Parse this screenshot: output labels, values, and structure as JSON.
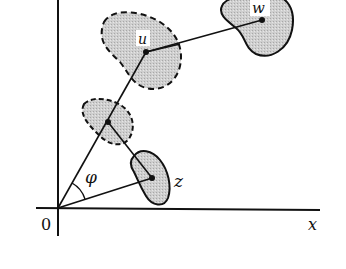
{
  "diagram": {
    "axes": {
      "x_label": "x",
      "origin_label": "0"
    },
    "points": {
      "u": {
        "label": "u",
        "x": 146,
        "y": 52
      },
      "w": {
        "label": "w",
        "x": 262,
        "y": 20
      },
      "z": {
        "label": "z",
        "x": 152,
        "y": 178
      },
      "mid": {
        "x": 108,
        "y": 122
      }
    },
    "angle_label": "φ",
    "colors": {
      "ink": "#111111",
      "fill": "#c9c9c9",
      "background": "#ffffff"
    }
  }
}
